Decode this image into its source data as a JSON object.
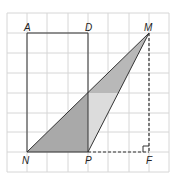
{
  "diagram": {
    "type": "geometry-grid",
    "grid": {
      "columns": 8,
      "rows": 8,
      "origin_x": 7,
      "origin_y": 13,
      "cell_size": 20.2,
      "line_color": "#d6d6d6"
    },
    "points": {
      "A": {
        "label": "A",
        "grid": [
          1,
          1
        ]
      },
      "D": {
        "label": "D",
        "grid": [
          4,
          1
        ]
      },
      "M": {
        "label": "M",
        "grid": [
          7,
          1
        ]
      },
      "N": {
        "label": "N",
        "grid": [
          1,
          7
        ]
      },
      "P": {
        "label": "P",
        "grid": [
          4,
          7
        ]
      },
      "F": {
        "label": "F",
        "grid": [
          7,
          7
        ]
      }
    },
    "segments": [
      {
        "from": "A",
        "to": "D",
        "style": "solid"
      },
      {
        "from": "A",
        "to": "N",
        "style": "solid"
      },
      {
        "from": "D",
        "to": "P",
        "style": "solid"
      },
      {
        "from": "N",
        "to": "M",
        "style": "solid"
      },
      {
        "from": "P",
        "to": "M",
        "style": "solid"
      },
      {
        "from": "N",
        "to": "P",
        "style": "solid"
      },
      {
        "from": "P",
        "to": "F",
        "style": "dashed"
      },
      {
        "from": "M",
        "to": "F",
        "style": "dashed"
      }
    ],
    "right_angle_marker": "F",
    "shaded_regions": [
      {
        "name": "triangle-left-of-DP",
        "color": "#a9a9a9"
      },
      {
        "name": "triangle-right-of-DP-upper",
        "color": "#b8b8b8"
      },
      {
        "name": "triangle-right-of-DP-lower",
        "color": "#dcdcdc"
      }
    ],
    "colors": {
      "line": "#333333",
      "dark_fill": "#a9a9a9",
      "mid_fill": "#b8b8b8",
      "light_fill": "#dcdcdc"
    }
  }
}
